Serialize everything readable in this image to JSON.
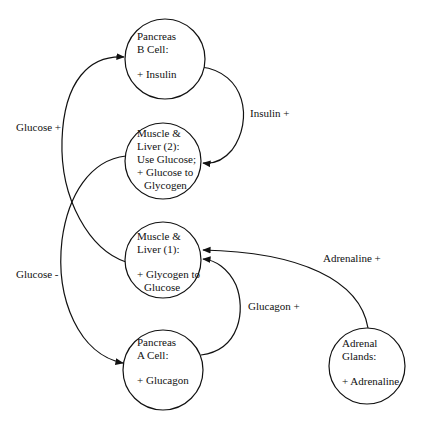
{
  "colors": {
    "stroke": "#111111",
    "background": "#ffffff",
    "text": "#111111"
  },
  "nodes": [
    {
      "id": "pancreas-b",
      "cx": 165,
      "cy": 59,
      "r": 40,
      "lines": [
        "Pancreas",
        "B Cell:",
        "",
        "+ Insulin"
      ]
    },
    {
      "id": "muscle-liver-2",
      "cx": 163,
      "cy": 161,
      "r": 38,
      "lines": [
        "Muscle &",
        "Liver (2):",
        "Use Glucose;",
        "+ Glucose to",
        "Glycogen"
      ]
    },
    {
      "id": "muscle-liver-1",
      "cx": 163,
      "cy": 260,
      "r": 38,
      "lines": [
        "Muscle &",
        "Liver (1):",
        "",
        "+ Glycogen to",
        "Glucose"
      ]
    },
    {
      "id": "pancreas-a",
      "cx": 163,
      "cy": 370,
      "r": 40,
      "lines": [
        "Pancreas",
        "A Cell:",
        "",
        "+ Glucagon"
      ]
    },
    {
      "id": "adrenal-glands",
      "cx": 367,
      "cy": 366,
      "r": 38,
      "lines": [
        "Adrenal",
        "Glands:",
        "",
        "+ Adrenaline"
      ]
    }
  ],
  "edges": [
    {
      "id": "insulin",
      "label": "Insulin +",
      "from": "pancreas-b",
      "to": "muscle-liver-2"
    },
    {
      "id": "glucose-plus",
      "label": "Glucose +",
      "from": "muscle-liver-1",
      "to": "pancreas-b"
    },
    {
      "id": "glucose-minus",
      "label": "Glucose -",
      "from": "muscle-liver-2",
      "to": "pancreas-a"
    },
    {
      "id": "glucagon",
      "label": "Glucagon +",
      "from": "pancreas-a",
      "to": "muscle-liver-1"
    },
    {
      "id": "adrenaline",
      "label": "Adrenaline +",
      "from": "adrenal-glands",
      "to": "muscle-liver-1"
    }
  ]
}
